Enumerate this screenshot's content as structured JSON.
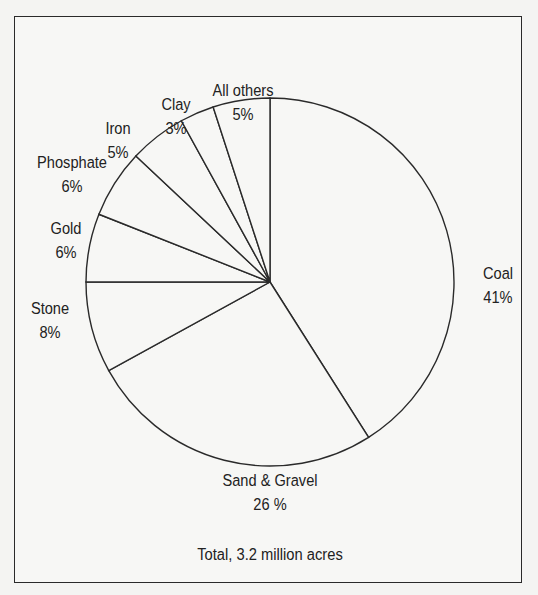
{
  "chart_data": {
    "type": "pie",
    "title": "",
    "footnote": "Total, 3.2 million acres",
    "start_angle": "12 o'clock",
    "direction": "clockwise",
    "slices": [
      {
        "label": "Coal",
        "value": 41,
        "value_label": "41%"
      },
      {
        "label": "Sand & Gravel",
        "value": 26,
        "value_label": "26 %"
      },
      {
        "label": "Stone",
        "value": 8,
        "value_label": "8%"
      },
      {
        "label": "Gold",
        "value": 6,
        "value_label": "6%"
      },
      {
        "label": "Phosphate",
        "value": 6,
        "value_label": "6%"
      },
      {
        "label": "Iron",
        "value": 5,
        "value_label": "5%"
      },
      {
        "label": "Clay",
        "value": 3,
        "value_label": "3%"
      },
      {
        "label": "All others",
        "value": 5,
        "value_label": "5%"
      }
    ],
    "colors": {
      "fill": "#f7f7f5",
      "stroke": "#2a2a2a"
    }
  }
}
